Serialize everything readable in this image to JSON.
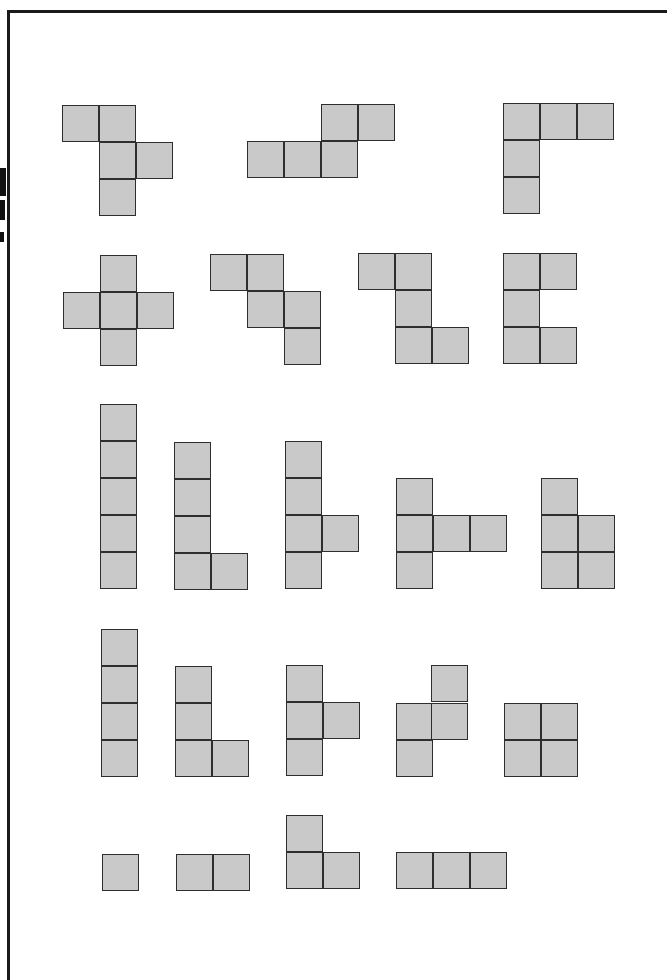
{
  "figure": {
    "title": "",
    "cell_size": 37,
    "colors": {
      "fill": "#c9c9c9",
      "stroke": "#2e2e2e",
      "frame": "#1a1a1a"
    }
  },
  "shapes": [
    {
      "name": "pentomino-f",
      "cells": [
        [
          62,
          105
        ],
        [
          99,
          105
        ],
        [
          99,
          142
        ],
        [
          136,
          142
        ],
        [
          99,
          179
        ]
      ]
    },
    {
      "name": "pentomino-n",
      "cells": [
        [
          321,
          104
        ],
        [
          358,
          104
        ],
        [
          247,
          141
        ],
        [
          284,
          141
        ],
        [
          321,
          141
        ]
      ]
    },
    {
      "name": "pentomino-v",
      "cells": [
        [
          503,
          103
        ],
        [
          540,
          103
        ],
        [
          577,
          103
        ],
        [
          503,
          140
        ],
        [
          503,
          177
        ]
      ]
    },
    {
      "name": "pentomino-x",
      "cells": [
        [
          100,
          255
        ],
        [
          63,
          292
        ],
        [
          100,
          292
        ],
        [
          137,
          292
        ],
        [
          100,
          329
        ]
      ]
    },
    {
      "name": "pentomino-w",
      "cells": [
        [
          210,
          254
        ],
        [
          247,
          254
        ],
        [
          247,
          291
        ],
        [
          284,
          291
        ],
        [
          284,
          328
        ]
      ]
    },
    {
      "name": "pentomino-z",
      "cells": [
        [
          358,
          253
        ],
        [
          395,
          253
        ],
        [
          395,
          290
        ],
        [
          395,
          327
        ],
        [
          432,
          327
        ]
      ]
    },
    {
      "name": "pentomino-u",
      "cells": [
        [
          503,
          253
        ],
        [
          540,
          253
        ],
        [
          503,
          290
        ],
        [
          503,
          327
        ],
        [
          540,
          327
        ]
      ]
    },
    {
      "name": "pentomino-i",
      "cells": [
        [
          100,
          404
        ],
        [
          100,
          441
        ],
        [
          100,
          478
        ],
        [
          100,
          515
        ],
        [
          100,
          552
        ]
      ]
    },
    {
      "name": "pentomino-l",
      "cells": [
        [
          174,
          442
        ],
        [
          174,
          479
        ],
        [
          174,
          516
        ],
        [
          174,
          553
        ],
        [
          211,
          553
        ]
      ]
    },
    {
      "name": "pentomino-y",
      "cells": [
        [
          285,
          441
        ],
        [
          285,
          478
        ],
        [
          285,
          515
        ],
        [
          285,
          552
        ],
        [
          322,
          515
        ]
      ]
    },
    {
      "name": "pentomino-t",
      "cells": [
        [
          396,
          478
        ],
        [
          396,
          515
        ],
        [
          433,
          515
        ],
        [
          470,
          515
        ],
        [
          396,
          552
        ]
      ]
    },
    {
      "name": "pentomino-p",
      "cells": [
        [
          541,
          478
        ],
        [
          541,
          515
        ],
        [
          578,
          515
        ],
        [
          541,
          552
        ],
        [
          578,
          552
        ]
      ]
    },
    {
      "name": "tetromino-i",
      "cells": [
        [
          101,
          629
        ],
        [
          101,
          666
        ],
        [
          101,
          703
        ],
        [
          101,
          740
        ]
      ]
    },
    {
      "name": "tetromino-l",
      "cells": [
        [
          175,
          666
        ],
        [
          175,
          703
        ],
        [
          175,
          740
        ],
        [
          212,
          740
        ]
      ]
    },
    {
      "name": "tetromino-t",
      "cells": [
        [
          286,
          665
        ],
        [
          286,
          702
        ],
        [
          286,
          739
        ],
        [
          323,
          702
        ]
      ]
    },
    {
      "name": "tetromino-s",
      "cells": [
        [
          431,
          665
        ],
        [
          396,
          703
        ],
        [
          431,
          703
        ],
        [
          396,
          740
        ]
      ]
    },
    {
      "name": "tetromino-o",
      "cells": [
        [
          504,
          703
        ],
        [
          541,
          703
        ],
        [
          504,
          740
        ],
        [
          541,
          740
        ]
      ]
    },
    {
      "name": "monomino",
      "cells": [
        [
          102,
          854
        ]
      ]
    },
    {
      "name": "domino",
      "cells": [
        [
          176,
          854
        ],
        [
          213,
          854
        ]
      ]
    },
    {
      "name": "tromino-l",
      "cells": [
        [
          286,
          815
        ],
        [
          286,
          852
        ],
        [
          323,
          852
        ]
      ]
    },
    {
      "name": "tromino-i",
      "cells": [
        [
          396,
          852
        ],
        [
          433,
          852
        ],
        [
          470,
          852
        ]
      ]
    }
  ]
}
